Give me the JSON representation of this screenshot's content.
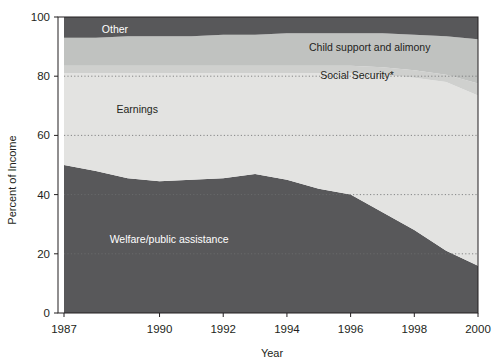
{
  "chart_data": {
    "type": "area",
    "stacked": true,
    "title": "",
    "xlabel": "Year",
    "ylabel": "Percent of Income",
    "xlim": [
      1987,
      2000
    ],
    "ylim": [
      0,
      100
    ],
    "xticks": [
      1987,
      1990,
      1992,
      1994,
      1996,
      1998,
      2000
    ],
    "xtick_labels": [
      "1987",
      "1990",
      "1992",
      "1994",
      "1996",
      "1998",
      "2000"
    ],
    "yticks": [
      0,
      20,
      40,
      60,
      80,
      100
    ],
    "ytick_labels": [
      "0",
      "20",
      "40",
      "60",
      "80",
      "100"
    ],
    "grid": "horizontal-dotted",
    "legend_position": "inline-annotations",
    "x": [
      1987,
      1988,
      1989,
      1990,
      1991,
      1992,
      1993,
      1994,
      1995,
      1996,
      1997,
      1998,
      1999,
      2000
    ],
    "series": [
      {
        "name": "Welfare/public assistance",
        "color": "#58585a",
        "label_color": "#ffffff",
        "values": [
          50.0,
          48.0,
          45.5,
          44.5,
          45.0,
          45.5,
          47.0,
          45.0,
          42.0,
          40.0,
          34.0,
          28.0,
          21.0,
          16.0
        ]
      },
      {
        "name": "Earnings",
        "color": "#e3e3e1",
        "label_color": "#231f20",
        "values": [
          31.0,
          33.0,
          35.5,
          36.5,
          36.0,
          35.5,
          34.0,
          36.0,
          39.0,
          41.0,
          46.5,
          51.5,
          57.0,
          57.5
        ]
      },
      {
        "name": "Social Security*",
        "color": "#cfd0ce",
        "label_color": "#231f20",
        "values": [
          2.5,
          2.5,
          2.5,
          2.5,
          2.5,
          2.5,
          2.5,
          2.5,
          2.5,
          2.5,
          2.5,
          2.5,
          2.5,
          4.0
        ]
      },
      {
        "name": "Child support and alimony",
        "color": "#c0c2c0",
        "label_color": "#231f20",
        "values": [
          9.5,
          9.5,
          10.0,
          10.0,
          10.0,
          10.5,
          10.5,
          11.0,
          11.0,
          11.0,
          11.5,
          12.0,
          13.0,
          15.0
        ]
      },
      {
        "name": "Other",
        "color": "#58585a",
        "label_color": "#ffffff",
        "values": [
          7.0,
          7.0,
          6.5,
          6.5,
          6.5,
          6.0,
          6.0,
          5.5,
          5.5,
          5.5,
          5.5,
          6.0,
          6.5,
          7.5
        ]
      }
    ],
    "annotations": [
      {
        "text": "Other",
        "x": 1988.6,
        "y": 96.0,
        "color": "#ffffff"
      },
      {
        "text": "Child support and alimony",
        "x": 1996.6,
        "y": 90.0,
        "color": "#231f20"
      },
      {
        "text": "Social Security*",
        "x": 1996.2,
        "y": 80.5,
        "color": "#231f20"
      },
      {
        "text": "Earnings",
        "x": 1989.3,
        "y": 69.0,
        "color": "#231f20"
      },
      {
        "text": "Welfare/public assistance",
        "x": 1990.3,
        "y": 25.0,
        "color": "#ffffff"
      }
    ],
    "footnote": ""
  }
}
